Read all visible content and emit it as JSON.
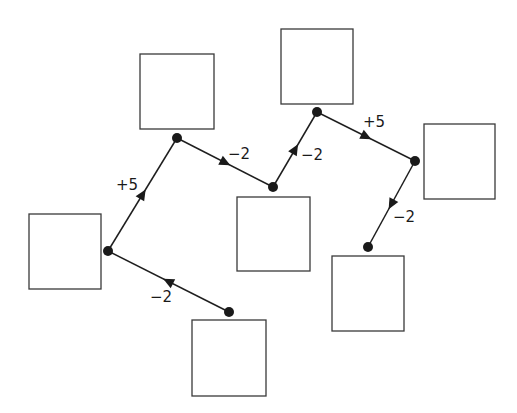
{
  "diagram": {
    "type": "directed-path-with-empty-boxes",
    "boxes": [
      {
        "id": "A",
        "x": 29,
        "y": 214,
        "w": 72,
        "h": 75
      },
      {
        "id": "B",
        "x": 140,
        "y": 54,
        "w": 74,
        "h": 75
      },
      {
        "id": "C",
        "x": 237,
        "y": 197,
        "w": 73,
        "h": 74
      },
      {
        "id": "D",
        "x": 281,
        "y": 29,
        "w": 72,
        "h": 75
      },
      {
        "id": "E",
        "x": 424,
        "y": 124,
        "w": 71,
        "h": 75
      },
      {
        "id": "F",
        "x": 332,
        "y": 256,
        "w": 72,
        "h": 75
      },
      {
        "id": "G",
        "x": 192,
        "y": 320,
        "w": 74,
        "h": 76
      }
    ],
    "nodes": [
      {
        "id": "G",
        "x": 229,
        "y": 312
      },
      {
        "id": "A",
        "x": 108,
        "y": 251
      },
      {
        "id": "B",
        "x": 177,
        "y": 138
      },
      {
        "id": "C",
        "x": 273,
        "y": 187
      },
      {
        "id": "D",
        "x": 317,
        "y": 112
      },
      {
        "id": "E",
        "x": 415,
        "y": 161
      },
      {
        "id": "F",
        "x": 368,
        "y": 247
      }
    ],
    "edges": [
      {
        "from": "G",
        "to": "A",
        "label": "−2",
        "label_x": 150,
        "label_y": 302
      },
      {
        "from": "A",
        "to": "B",
        "label": "+5",
        "label_x": 116,
        "label_y": 190
      },
      {
        "from": "B",
        "to": "C",
        "label": "−2",
        "label_x": 228,
        "label_y": 159
      },
      {
        "from": "C",
        "to": "D",
        "label": "−2",
        "label_x": 301,
        "label_y": 160
      },
      {
        "from": "D",
        "to": "E",
        "label": "+5",
        "label_x": 363,
        "label_y": 127
      },
      {
        "from": "E",
        "to": "F",
        "label": "−2",
        "label_x": 393,
        "label_y": 222
      }
    ],
    "colors": {
      "stroke": "#1e1e1e",
      "box_stroke": "#3a3a3a",
      "background": "#ffffff"
    }
  }
}
